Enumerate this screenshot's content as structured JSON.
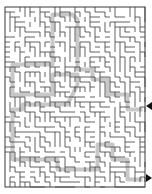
{
  "puzzle": {
    "type": "maze",
    "grid": {
      "cols": 28,
      "rows": 36,
      "cell": 5,
      "origin_x": 5,
      "origin_y": 7
    },
    "colors": {
      "wall": "#3a3a3a",
      "path": "#c8c8c8",
      "background": "#ffffff",
      "arrow": "#111111"
    },
    "entrance": {
      "side": "right",
      "arrow": "left-pointing",
      "y": 106
    },
    "exit": {
      "side": "right",
      "arrow": "right-pointing",
      "y": 178
    },
    "solution_path": [
      [
        27,
        20
      ],
      [
        24,
        20
      ],
      [
        24,
        17
      ],
      [
        20,
        17
      ],
      [
        20,
        14
      ],
      [
        17,
        14
      ],
      [
        17,
        12
      ],
      [
        14,
        12
      ],
      [
        14,
        2
      ],
      [
        13,
        1
      ],
      [
        9,
        1
      ],
      [
        9,
        10
      ],
      [
        9,
        11
      ],
      [
        1,
        11
      ],
      [
        1,
        17
      ],
      [
        9,
        17
      ],
      [
        9,
        13
      ],
      [
        14,
        13
      ],
      [
        14,
        15
      ],
      [
        12,
        19
      ],
      [
        3,
        19
      ],
      [
        3,
        20
      ],
      [
        1,
        20
      ],
      [
        1,
        30
      ],
      [
        10,
        30
      ],
      [
        10,
        32
      ],
      [
        18,
        32
      ],
      [
        18,
        27
      ],
      [
        21,
        27
      ],
      [
        21,
        30
      ],
      [
        24,
        30
      ],
      [
        24,
        34
      ],
      [
        27,
        34
      ]
    ]
  }
}
